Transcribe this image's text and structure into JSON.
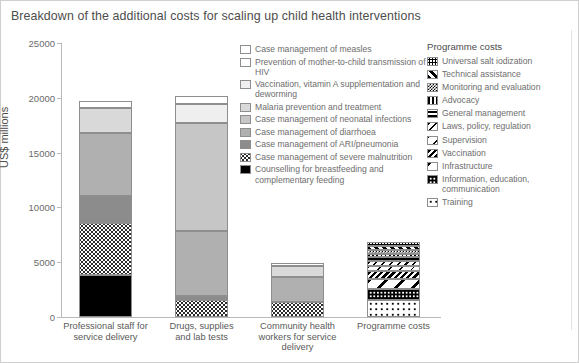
{
  "title": "Breakdown of the additional costs for scaling up child health interventions",
  "axis": {
    "ylabel": "US$ millions",
    "yticks": [
      "25000",
      "20000",
      "15000",
      "10000",
      "5000",
      "0"
    ]
  },
  "categories": [
    "Professional staff for\nservice delivery",
    "Drugs, supplies\nand lab tests",
    "Community health\nworkers for service\ndelivery",
    "Programme costs"
  ],
  "legend_left": {
    "items": [
      {
        "label": "Case management of measles",
        "pattern": "p-white"
      },
      {
        "label": "Prevention of mother-to-child transmission of HIV",
        "pattern": "p-white"
      },
      {
        "label": "Vaccination, vitamin A supplementation and deworming",
        "pattern": "p-vlight"
      },
      {
        "label": "Malaria prevention and treatment",
        "pattern": "p-light"
      },
      {
        "label": "Case management of neonatal infections",
        "pattern": "p-midlight"
      },
      {
        "label": "Case management of diarrhoea",
        "pattern": "p-mid"
      },
      {
        "label": "Case management of ARI/pneumonia",
        "pattern": "p-dark"
      },
      {
        "label": "Case management of severe malnutrition",
        "pattern": "p-dots"
      },
      {
        "label": "Counselling for breastfeeding and complementary feeding",
        "pattern": "p-black"
      }
    ]
  },
  "legend_right": {
    "heading": "Programme costs",
    "items": [
      {
        "label": "Universal salt iodization",
        "pattern": "p-saltdot"
      },
      {
        "label": "Technical assistance",
        "pattern": "p-diagbold"
      },
      {
        "label": "Monitoring and evaluation",
        "pattern": "p-checker"
      },
      {
        "label": "Advocacy",
        "pattern": "p-vert"
      },
      {
        "label": "General management",
        "pattern": "p-horz"
      },
      {
        "label": "Laws, policy, regulation",
        "pattern": "p-diagback"
      },
      {
        "label": "Supervision",
        "pattern": "p-diagsparse"
      },
      {
        "label": "Vaccination",
        "pattern": "p-diagdense"
      },
      {
        "label": "Infrastructure",
        "pattern": "p-diagwide"
      },
      {
        "label": "Information, education, communication",
        "pattern": "p-blocks"
      },
      {
        "label": "Training",
        "pattern": "p-sparsedot"
      }
    ]
  },
  "chart_data": {
    "type": "bar",
    "stacked": true,
    "title": "Breakdown of the additional costs for scaling up child health interventions",
    "xlabel": "",
    "ylabel": "US$ millions",
    "ylim": [
      0,
      25000
    ],
    "yticks": [
      0,
      5000,
      10000,
      15000,
      20000,
      25000
    ],
    "grid": false,
    "legend_position": "inside-right",
    "categories": [
      "Professional staff for service delivery",
      "Drugs, supplies and lab tests",
      "Community health workers for service delivery",
      "Programme costs"
    ],
    "series": [
      {
        "name": "Counselling for breastfeeding and complementary feeding",
        "pattern": "p-black",
        "values": [
          3850,
          0,
          0,
          0
        ]
      },
      {
        "name": "Case management of severe malnutrition",
        "pattern": "p-dots",
        "values": [
          4750,
          1550,
          1350,
          0
        ]
      },
      {
        "name": "Case management of ARI/pneumonia",
        "pattern": "p-dark",
        "values": [
          2450,
          400,
          0,
          0
        ]
      },
      {
        "name": "Case management of diarrhoea",
        "pattern": "p-mid",
        "values": [
          5750,
          5900,
          2300,
          0
        ]
      },
      {
        "name": "Case management of neonatal infections",
        "pattern": "p-midlight",
        "values": [
          0,
          9850,
          0,
          0
        ]
      },
      {
        "name": "Malaria prevention and treatment",
        "pattern": "p-light",
        "values": [
          2300,
          0,
          1000,
          0
        ]
      },
      {
        "name": "Vaccination, vitamin A supplementation and deworming",
        "pattern": "p-vlight",
        "values": [
          0,
          1750,
          0,
          0
        ]
      },
      {
        "name": "Prevention of mother-to-child transmission of HIV",
        "pattern": "p-white",
        "values": [
          650,
          750,
          250,
          0
        ]
      },
      {
        "name": "Case management of measles",
        "pattern": "p-white",
        "values": [
          0,
          0,
          0,
          0
        ]
      },
      {
        "name": "Training",
        "pattern": "p-sparsedot",
        "values": [
          0,
          0,
          0,
          1550
        ]
      },
      {
        "name": "Information, education, communication",
        "pattern": "p-blocks",
        "values": [
          0,
          0,
          0,
          1000
        ]
      },
      {
        "name": "Infrastructure",
        "pattern": "p-diagwide",
        "values": [
          0,
          0,
          0,
          950
        ]
      },
      {
        "name": "Vaccination",
        "pattern": "p-diagdense",
        "values": [
          0,
          0,
          0,
          700
        ]
      },
      {
        "name": "Supervision",
        "pattern": "p-diagsparse",
        "values": [
          0,
          0,
          0,
          500
        ]
      },
      {
        "name": "Laws, policy, regulation",
        "pattern": "p-diagback",
        "values": [
          0,
          0,
          0,
          420
        ]
      },
      {
        "name": "General management",
        "pattern": "p-horz",
        "values": [
          0,
          0,
          0,
          330
        ]
      },
      {
        "name": "Advocacy",
        "pattern": "p-vert",
        "values": [
          0,
          0,
          0,
          280
        ]
      },
      {
        "name": "Monitoring and evaluation",
        "pattern": "p-checker",
        "values": [
          0,
          0,
          0,
          380
        ]
      },
      {
        "name": "Technical assistance",
        "pattern": "p-diagbold",
        "values": [
          0,
          0,
          0,
          400
        ]
      },
      {
        "name": "Universal salt iodization",
        "pattern": "p-saltdot",
        "values": [
          0,
          0,
          0,
          340
        ]
      }
    ],
    "totals": [
      19750,
      20200,
      4900,
      6850
    ]
  }
}
